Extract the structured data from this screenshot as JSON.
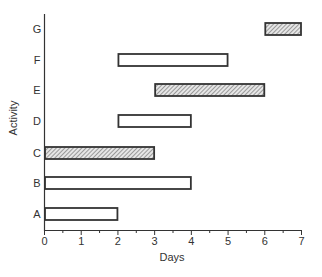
{
  "chart_data": {
    "type": "bar",
    "orientation": "horizontal",
    "subtype": "gantt",
    "title": "",
    "xlabel": "Days",
    "ylabel": "Activity",
    "xlim": [
      0,
      7
    ],
    "xticks": [
      "0",
      "1",
      "2",
      "3",
      "4",
      "5",
      "6",
      "7"
    ],
    "grid": false,
    "legend": null,
    "categories": [
      "A",
      "B",
      "C",
      "D",
      "E",
      "F",
      "G"
    ],
    "bars": [
      {
        "activity": "A",
        "start": 0,
        "end": 2,
        "style": "open"
      },
      {
        "activity": "B",
        "start": 0,
        "end": 4,
        "style": "open"
      },
      {
        "activity": "C",
        "start": 0,
        "end": 3,
        "style": "hatched"
      },
      {
        "activity": "D",
        "start": 2,
        "end": 4,
        "style": "open"
      },
      {
        "activity": "E",
        "start": 3,
        "end": 6,
        "style": "hatched"
      },
      {
        "activity": "F",
        "start": 2,
        "end": 5,
        "style": "open"
      },
      {
        "activity": "G",
        "start": 6,
        "end": 7,
        "style": "hatched"
      }
    ]
  },
  "colors": {
    "axis": "#333333",
    "bar_border": "#333333",
    "hatch": "#555555",
    "open_fill": "#ffffff"
  }
}
